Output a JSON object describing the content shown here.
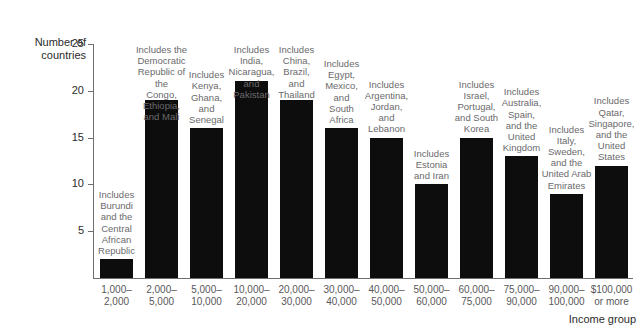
{
  "chart_data": {
    "type": "bar",
    "title": "",
    "xlabel": "Income group",
    "ylabel": "Number of\ncountries",
    "ylim": [
      0,
      25
    ],
    "yticks": [
      5,
      10,
      15,
      20,
      25
    ],
    "grid": false,
    "legend": "none",
    "bar_color": "#0d0d0d",
    "categories": [
      "1,000–\n2,000",
      "2,000–\n5,000",
      "5,000–\n10,000",
      "10,000–\n20,000",
      "20,000–\n30,000",
      "30,000–\n40,000",
      "40,000–\n50,000",
      "50,000–\n60,000",
      "60,000–\n75,000",
      "75,000–\n90,000",
      "90,000–\n100,000",
      "$100,000\nor more"
    ],
    "values": [
      2,
      19,
      16,
      21,
      19,
      16,
      15,
      10,
      15,
      13,
      9,
      12
    ],
    "annotations": [
      "Includes\nBurundi\nand the\nCentral\nAfrican\nRepublic",
      "Includes the\nDemocratic\nRepublic of the\nCongo,\nEthiopia,\nand Mali",
      "Includes\nKenya,\nGhana,\nand\nSenegal",
      "Includes\nIndia,\nNicaragua,\nand\nPakistan",
      "Includes\nChina,\nBrazil,\nand\nThailand",
      "Includes\nEgypt,\nMexico,\nand\nSouth\nAfrica",
      "Includes\nArgentina,\nJordan,\nand\nLebanon",
      "Includes\nEstonia\nand Iran",
      "Includes\nIsrael,\nPortugal,\nand South\nKorea",
      "Includes\nAustralia,\nSpain,\nand the\nUnited\nKingdom",
      "Includes\nItaly,\nSweden,\nand the\nUnited Arab\nEmirates",
      "Includes\nQatar,\nSingapore,\nand the\nUnited\nStates"
    ]
  }
}
